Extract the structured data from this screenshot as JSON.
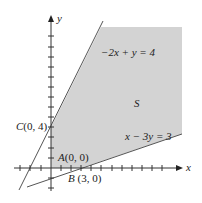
{
  "diagram": {
    "type": "feasible-region-graph",
    "axes": {
      "x_label": "x",
      "y_label": "y"
    },
    "region_label": "S",
    "lines": [
      {
        "equation": "−2x + y = 4"
      },
      {
        "equation": "x − 3y = 3"
      }
    ],
    "points": [
      {
        "name": "A",
        "coords": "(0, 0)"
      },
      {
        "name": "B",
        "coords": "(3, 0)"
      },
      {
        "name": "C",
        "coords": "(0, 4)"
      }
    ],
    "colors": {
      "region_fill": "#d3d3d3",
      "line": "#555555",
      "axis": "#333333"
    }
  }
}
